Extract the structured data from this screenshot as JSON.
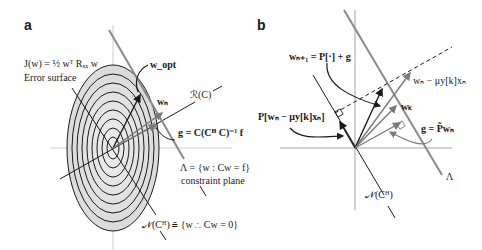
{
  "figure": {
    "panel_a": {
      "label": "a",
      "error_surface_eq": "J(w) = ½ wᵀ Rₓₓ w",
      "error_surface_label": "Error surface",
      "w_opt": "w_opt",
      "w_n": "wₙ",
      "range_label": "ℛ(C)",
      "g_eq": "g = C(Cᴴ C)⁻¹ f",
      "constraint_eq": "Λ = {w : Cw = f}",
      "constraint_label": "constraint plane",
      "nullspace_eq": "𝒩(Cᴴ) ≜ {w ∴ Cw = 0}",
      "contour_count": 9
    },
    "panel_b": {
      "label": "b",
      "update_eq": "wₙ₊₁ = P[·] + g",
      "projection_eq": "P[wₙ − μy[k]xₙ]",
      "step_eq": "wₙ − μy[k]xₙ",
      "w_k": "wₖ",
      "g_eq": "g = P̃wₙ",
      "lambda": "Λ",
      "nullspace": "𝒩(Cᴴ)"
    },
    "colors": {
      "ellipse_fill": "#dcdcdc",
      "contour": "#1a1a1a",
      "constraint_line": "#8a8a8a",
      "axis": "#b0b0b0",
      "dark_arrow": "#1a1a1a",
      "grey_arrow": "#7a7a7a"
    }
  }
}
